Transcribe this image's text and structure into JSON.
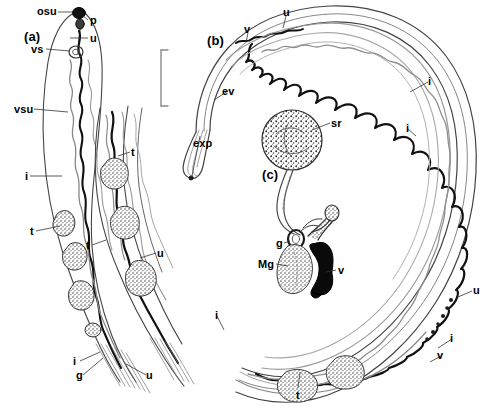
{
  "figure": {
    "domain": "scientific-line-drawing",
    "background_color": "#ffffff",
    "ink_color": "#000000",
    "width": 490,
    "height": 410,
    "caption_visible": false
  },
  "scale_bar": {
    "name": "scale-bar",
    "orientation": "vertical",
    "has_end_caps": true,
    "x": 161,
    "y_top": 50,
    "y_bottom": 106,
    "label": ""
  },
  "panels": [
    {
      "id": "a",
      "label": "(a)",
      "x": 24,
      "y": 30,
      "description": "anterior body region with oral sucker, pharynx, ventral sucker and uterus"
    },
    {
      "id": "b",
      "label": "(b)",
      "x": 207,
      "y": 34,
      "description": "posterior extremity showing excretory vesicle and excretory pore"
    },
    {
      "id": "c",
      "label": "(c)",
      "x": 262,
      "y": 168,
      "description": "terminal genitalia with seminal receptacle, ootype, Mehlis gland and vitelline duct"
    }
  ],
  "legend_keys": [
    {
      "abbr": "osu",
      "term": "oral sucker"
    },
    {
      "abbr": "p",
      "term": "pharynx"
    },
    {
      "abbr": "u",
      "term": "uterus"
    },
    {
      "abbr": "vs",
      "term": "ventral sucker"
    },
    {
      "abbr": "vsu",
      "term": "ventral sucker region"
    },
    {
      "abbr": "i",
      "term": "intestinal caecum"
    },
    {
      "abbr": "t",
      "term": "testis"
    },
    {
      "abbr": "g",
      "term": "germarium"
    },
    {
      "abbr": "v",
      "term": "vitellaria"
    },
    {
      "abbr": "ev",
      "term": "excretory vesicle"
    },
    {
      "abbr": "exp",
      "term": "excretory pore"
    },
    {
      "abbr": "sr",
      "term": "seminal receptacle"
    },
    {
      "abbr": "Mg",
      "term": "Mehlis gland"
    }
  ],
  "labels": [
    {
      "name": "label-osu",
      "text": "osu",
      "x": 37,
      "y": 6,
      "size": "normal"
    },
    {
      "name": "label-p",
      "text": "p",
      "x": 90,
      "y": 15,
      "size": "normal"
    },
    {
      "name": "label-u-a1",
      "text": "u",
      "x": 90,
      "y": 33,
      "size": "normal"
    },
    {
      "name": "label-vs",
      "text": "vs",
      "x": 31,
      "y": 44,
      "size": "normal"
    },
    {
      "name": "label-vsu",
      "text": "vsu",
      "x": 14,
      "y": 104,
      "size": "normal"
    },
    {
      "name": "label-i-a1",
      "text": "i",
      "x": 25,
      "y": 171,
      "size": "normal"
    },
    {
      "name": "label-t-a1",
      "text": "t",
      "x": 30,
      "y": 226,
      "size": "normal"
    },
    {
      "name": "label-t-mid1",
      "text": "t",
      "x": 131,
      "y": 147,
      "size": "normal"
    },
    {
      "name": "label-t-a2",
      "text": "t",
      "x": 86,
      "y": 240,
      "size": "normal"
    },
    {
      "name": "label-u-mid1",
      "text": "u",
      "x": 157,
      "y": 248,
      "size": "normal"
    },
    {
      "name": "label-i-a2",
      "text": "i",
      "x": 73,
      "y": 356,
      "size": "normal"
    },
    {
      "name": "label-g-a1",
      "text": "g",
      "x": 76,
      "y": 370,
      "size": "normal"
    },
    {
      "name": "label-u-a2",
      "text": "u",
      "x": 146,
      "y": 370,
      "size": "normal"
    },
    {
      "name": "label-v-b1",
      "text": "v",
      "x": 244,
      "y": 24,
      "size": "normal"
    },
    {
      "name": "label-u-b1",
      "text": "u",
      "x": 283,
      "y": 7,
      "size": "normal"
    },
    {
      "name": "label-ev",
      "text": "ev",
      "x": 222,
      "y": 86,
      "size": "normal"
    },
    {
      "name": "label-exp",
      "text": "exp",
      "x": 193,
      "y": 138,
      "size": "normal"
    },
    {
      "name": "label-sr",
      "text": "sr",
      "x": 331,
      "y": 118,
      "size": "normal"
    },
    {
      "name": "label-g-c1",
      "text": "g",
      "x": 276,
      "y": 238,
      "size": "normal"
    },
    {
      "name": "label-Mg",
      "text": "Mg",
      "x": 258,
      "y": 259,
      "size": "normal"
    },
    {
      "name": "label-v-c1",
      "text": "v",
      "x": 338,
      "y": 265,
      "size": "normal"
    },
    {
      "name": "label-i-r1",
      "text": "i",
      "x": 428,
      "y": 76,
      "size": "normal"
    },
    {
      "name": "label-i-r2",
      "text": "i",
      "x": 406,
      "y": 123,
      "size": "normal"
    },
    {
      "name": "label-u-r1",
      "text": "u",
      "x": 473,
      "y": 285,
      "size": "normal"
    },
    {
      "name": "label-i-r3",
      "text": "i",
      "x": 450,
      "y": 333,
      "size": "normal"
    },
    {
      "name": "label-v-r1",
      "text": "v",
      "x": 437,
      "y": 350,
      "size": "normal"
    },
    {
      "name": "label-i-bot",
      "text": "i",
      "x": 215,
      "y": 310,
      "size": "normal"
    },
    {
      "name": "label-t-bot",
      "text": "t",
      "x": 296,
      "y": 390,
      "size": "normal"
    }
  ]
}
